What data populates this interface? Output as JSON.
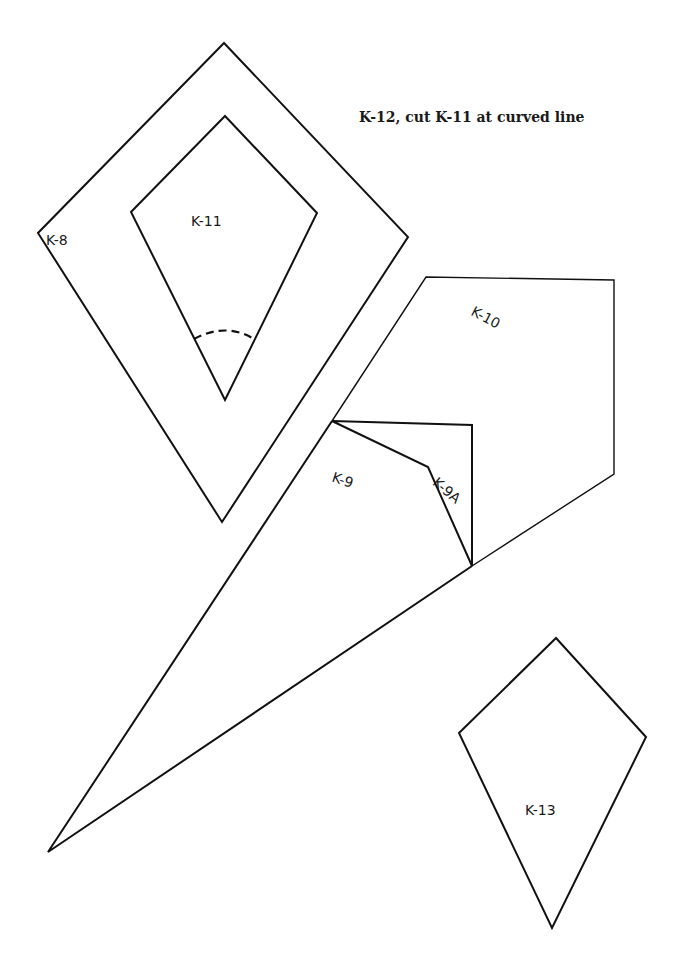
{
  "page": {
    "title": "K-12, cut K-11 at curved line"
  },
  "pieces": [
    {
      "id": "K-8",
      "label": "K-8"
    },
    {
      "id": "K-11",
      "label": "K-11"
    },
    {
      "id": "K-10",
      "label": "K-10"
    },
    {
      "id": "K-9",
      "label": "K-9"
    },
    {
      "id": "K-9A",
      "label": "K-9A"
    },
    {
      "id": "K-13",
      "label": "K-13"
    }
  ],
  "colors": {
    "line": "#111111",
    "background": "#ffffff"
  }
}
